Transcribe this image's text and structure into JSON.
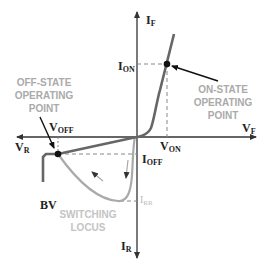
{
  "diagram": {
    "axes": {
      "i_forward": {
        "main": "I",
        "sub": "F"
      },
      "i_reverse": {
        "main": "I",
        "sub": "R"
      },
      "v_forward": {
        "main": "V",
        "sub": "F"
      },
      "v_reverse": {
        "main": "V",
        "sub": "R"
      }
    },
    "labels": {
      "i_on": {
        "main": "I",
        "sub": "ON"
      },
      "v_on": {
        "main": "V",
        "sub": "ON"
      },
      "v_off": {
        "main": "V",
        "sub": "OFF"
      },
      "i_off": {
        "main": "I",
        "sub": "OFF"
      },
      "i_rr": {
        "main": "I",
        "sub": "RR"
      },
      "bv": "BV"
    },
    "annotations": {
      "off_state": [
        "OFF-STATE",
        "OPERATING",
        "POINT"
      ],
      "on_state": [
        "ON-STATE",
        "OPERATING",
        "POINT"
      ],
      "switching_locus": [
        "SWITCHING",
        "LOCUS"
      ]
    },
    "colors": {
      "axis": "#333333",
      "curve": "#666666",
      "locus": "#aaaaaa",
      "dashed": "#888888",
      "annotation_text": "#aaaaaa",
      "label_text": "#222222"
    }
  }
}
